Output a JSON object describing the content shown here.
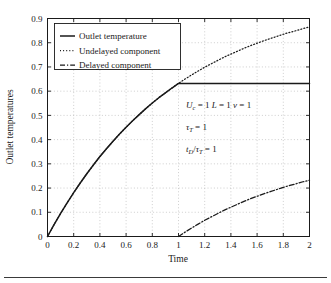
{
  "figure": {
    "background": "#ffffff",
    "frame_color": "#1a1a1a",
    "grid_color": "#b9b9b9",
    "bottom_rule": true
  },
  "legend": {
    "position": "top-left-inside",
    "entries": [
      {
        "label": "Outlet temperature",
        "style": "solid",
        "sample": "solid-line-sample"
      },
      {
        "label": "Undelayed component",
        "style": "dotted",
        "sample": "dotted-line-sample"
      },
      {
        "label": "Delayed component",
        "style": "dashdot",
        "sample": "dashdot-line-sample"
      }
    ]
  },
  "annotations": {
    "line1": {
      "u_sym": "U",
      "u_sub": "c",
      "eq1": " = 1 ",
      "l_sym": "L",
      "eq2": " = 1 ",
      "v_sym": "v",
      "eq3": " = 1"
    },
    "line2": {
      "tau_sym": "τ",
      "tau_sub": "T",
      "eq": " = 1"
    },
    "line3": {
      "t_sym": "t",
      "t_sub": "D",
      "slash": "/",
      "tau_sym": "τ",
      "tau_sub": "T",
      "eq": " = 1"
    },
    "plain_text": [
      "U_c = 1 L = 1 v = 1",
      "τ_T = 1",
      "t_D/τ_T = 1"
    ]
  },
  "chart_data": {
    "type": "line",
    "title": "",
    "xlabel": "Time",
    "ylabel": "Outlet temperatures",
    "xlim": [
      0,
      2
    ],
    "ylim": [
      0,
      0.9
    ],
    "grid": true,
    "legend_position": "upper left",
    "xticks": [
      0,
      0.2,
      0.4,
      0.6,
      0.8,
      1,
      1.2,
      1.4,
      1.6,
      1.8,
      2
    ],
    "xticklabels": [
      "0",
      "0.2",
      "0.4",
      "0.6",
      "0.8",
      "1",
      "1.2",
      "1.4",
      "1.6",
      "1.8",
      "2"
    ],
    "yticks": [
      0,
      0.1,
      0.2,
      0.3,
      0.4,
      0.5,
      0.6,
      0.7,
      0.8,
      0.9
    ],
    "yticklabels": [
      "0",
      "0.1",
      "0.2",
      "0.3",
      "0.4",
      "0.5",
      "0.6",
      "0.7",
      "0.8",
      "0.9"
    ],
    "x": [
      0,
      0.05,
      0.1,
      0.15,
      0.2,
      0.25,
      0.3,
      0.35,
      0.4,
      0.45,
      0.5,
      0.55,
      0.6,
      0.65,
      0.7,
      0.75,
      0.8,
      0.85,
      0.9,
      0.95,
      1.0,
      1.05,
      1.1,
      1.15,
      1.2,
      1.25,
      1.3,
      1.35,
      1.4,
      1.45,
      1.5,
      1.55,
      1.6,
      1.65,
      1.7,
      1.75,
      1.8,
      1.85,
      1.9,
      1.95,
      2.0
    ],
    "series": [
      {
        "name": "Outlet temperature",
        "style": "solid",
        "color": "#1a1a1a",
        "values": [
          0,
          0.049,
          0.095,
          0.139,
          0.181,
          0.221,
          0.259,
          0.295,
          0.33,
          0.362,
          0.393,
          0.423,
          0.451,
          0.478,
          0.503,
          0.528,
          0.551,
          0.573,
          0.593,
          0.613,
          0.632,
          0.632,
          0.632,
          0.632,
          0.632,
          0.632,
          0.632,
          0.632,
          0.632,
          0.632,
          0.632,
          0.632,
          0.632,
          0.632,
          0.632,
          0.632,
          0.632,
          0.632,
          0.632,
          0.632,
          0.632
        ]
      },
      {
        "name": "Undelayed component",
        "style": "dotted",
        "color": "#1a1a1a",
        "values": [
          0,
          0.049,
          0.095,
          0.139,
          0.181,
          0.221,
          0.259,
          0.295,
          0.33,
          0.362,
          0.393,
          0.423,
          0.451,
          0.478,
          0.503,
          0.528,
          0.551,
          0.573,
          0.593,
          0.613,
          0.632,
          0.65,
          0.667,
          0.683,
          0.699,
          0.713,
          0.727,
          0.741,
          0.753,
          0.765,
          0.777,
          0.788,
          0.798,
          0.808,
          0.817,
          0.826,
          0.835,
          0.843,
          0.85,
          0.858,
          0.865
        ]
      },
      {
        "name": "Delayed component",
        "style": "dashdot",
        "color": "#1a1a1a",
        "values": [
          null,
          null,
          null,
          null,
          null,
          null,
          null,
          null,
          null,
          null,
          null,
          null,
          null,
          null,
          null,
          null,
          null,
          null,
          null,
          null,
          0,
          0.018,
          0.035,
          0.051,
          0.067,
          0.081,
          0.095,
          0.109,
          0.121,
          0.133,
          0.145,
          0.156,
          0.166,
          0.176,
          0.185,
          0.194,
          0.203,
          0.211,
          0.218,
          0.226,
          0.232
        ]
      }
    ]
  }
}
